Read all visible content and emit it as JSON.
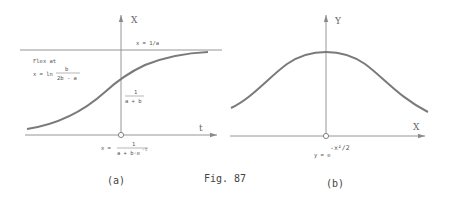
{
  "figure": {
    "caption": "Fig. 87",
    "panels": [
      {
        "id": "a",
        "label": "(a)",
        "y_axis_label": "X",
        "x_axis_label": "t",
        "asymptote_label": "x = 1/a",
        "flex_label_line1": "Flex at",
        "flex_label_line2_prefix": "x = ln",
        "flex_fraction_num": "b",
        "flex_fraction_den": "2b - a",
        "intercept_fraction_num": "1",
        "intercept_fraction_den": "a + b",
        "formula_prefix": "x =",
        "formula_num": "1",
        "formula_den": "a + b·e",
        "formula_den_exp": "-t",
        "curve_type": "logistic"
      },
      {
        "id": "b",
        "label": "(b)",
        "y_axis_label": "Y",
        "x_axis_label": "X",
        "formula_prefix": "y = e",
        "formula_exp": "-x²/2",
        "curve_type": "gaussian"
      }
    ]
  },
  "colors": {
    "curve": "#7a7a7a",
    "axis": "#8a8a8a",
    "text": "#555555"
  }
}
